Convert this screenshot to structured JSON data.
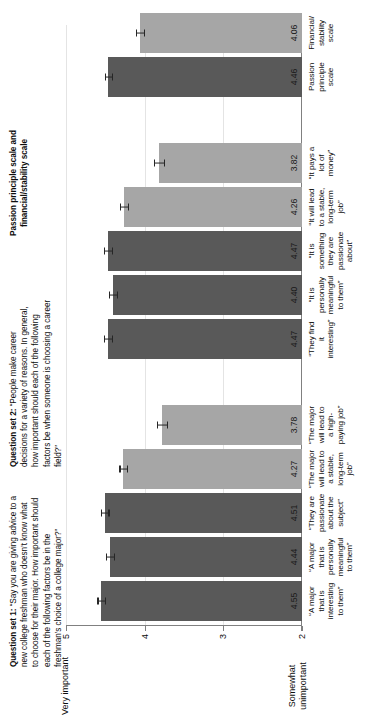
{
  "notes": {
    "q1_label": "Question set 1:",
    "q1_text": " “Say you are giving advice to a new college freshman who doesn’t know what to choose for their major. How important should each of the following factors be in the freshman’s choice of a college major?”",
    "q2_label": "Question set 2:",
    "q2_text": " “People make career decisions for a variety of reasons. In general, how important should each of the following factors be when someone is choosing a career field?”",
    "scale_header": "Passion principle scale and financial/stability scale"
  },
  "axis": {
    "top_word": "Very important",
    "bottom_word": "Somewhat unimportant",
    "ticks": [
      "5",
      "4",
      "3",
      "2"
    ]
  },
  "colors": {
    "dark_bar": "#595959",
    "light_bar": "#a6a6a6",
    "gridline": "#e4e4e4",
    "axis": "#808080"
  },
  "chart_data": {
    "type": "bar",
    "title": "",
    "xlabel": "",
    "ylabel": "",
    "ylim": [
      2,
      5
    ],
    "yticks": [
      5,
      4,
      3,
      2
    ],
    "grid": true,
    "legend": "none",
    "orientation": "vertical",
    "categories": [
      "“A major that is interesting to them”",
      "“A major that is personally meaningful to them”",
      "“They are passionate about the subject”",
      "“The major will lead to a stable, long-term job”",
      "“The major will lead to a high-paying job”",
      "“They find it interesting”",
      "“It is personally meaningful to them”",
      "“It is something they are passionate about”",
      "“It will lead to a stable, long-term job”",
      "“It pays a lot of money”",
      "Passion principle scale",
      "Financial/stability scale"
    ],
    "values": [
      4.55,
      4.44,
      4.51,
      4.27,
      3.78,
      4.47,
      4.4,
      4.47,
      4.26,
      3.82,
      4.46,
      4.06
    ],
    "bar_colors": [
      "dark",
      "dark",
      "dark",
      "light",
      "light",
      "dark",
      "dark",
      "dark",
      "light",
      "light",
      "dark",
      "light"
    ],
    "errors": [
      0.05,
      0.05,
      0.05,
      0.05,
      0.06,
      0.05,
      0.05,
      0.05,
      0.05,
      0.06,
      0.04,
      0.05
    ],
    "groups": [
      {
        "name": "Question set 1",
        "indices": [
          0,
          1,
          2,
          3,
          4
        ]
      },
      {
        "name": "Question set 2",
        "indices": [
          5,
          6,
          7,
          8,
          9
        ]
      },
      {
        "name": "Scales",
        "indices": [
          10,
          11
        ]
      }
    ]
  },
  "labels": {
    "cat_0": "“A major\nthat is\ninteresting\nto them”",
    "cat_1": "“A major\nthat is\npersonally\nmeaningful\nto them”",
    "cat_2": "“They are\npassionate\nabout the\nsubject”",
    "cat_3": "“The major\nwill lead to\na stable,\nlong-term\njob”",
    "cat_4": "“The major\nwill lead to\na high-\npaying job”",
    "cat_5": "“They find\nit\ninteresting”",
    "cat_6": "“It is\npersonally\nmeaningful\nto them”",
    "cat_7": "“It is\nsomething\nthey are\npassionate\nabout”",
    "cat_8": "“It will lead\nto a stable,\nlong-term\njob”",
    "cat_9": "“It pays a\nlot of\nmoney”",
    "cat_10": "Passion\nprinciple\nscale",
    "cat_11": "Financial/\nstability\nscale"
  },
  "values_text": {
    "v0": "4.55",
    "v1": "4.44",
    "v2": "4.51",
    "v3": "4.27",
    "v4": "3.78",
    "v5": "4.47",
    "v6": "4.40",
    "v7": "4.47",
    "v8": "4.26",
    "v9": "3.82",
    "v10": "4.46",
    "v11": "4.06"
  }
}
